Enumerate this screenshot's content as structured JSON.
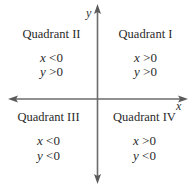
{
  "diagram": {
    "axes": {
      "x_label": "x",
      "y_label": "y",
      "color": "#6b6b6b"
    },
    "quadrants": [
      {
        "id": "I",
        "label": "Quadrant I",
        "x_condition": {
          "var": "x",
          "op": ">",
          "val": "0"
        },
        "y_condition": {
          "var": "y",
          "op": ">",
          "val": "0"
        }
      },
      {
        "id": "II",
        "label": "Quadrant II",
        "x_condition": {
          "var": "x",
          "op": "<",
          "val": "0"
        },
        "y_condition": {
          "var": "y",
          "op": ">",
          "val": "0"
        }
      },
      {
        "id": "III",
        "label": "Quadrant III",
        "x_condition": {
          "var": "x",
          "op": "<",
          "val": "0"
        },
        "y_condition": {
          "var": "y",
          "op": "<",
          "val": "0"
        }
      },
      {
        "id": "IV",
        "label": "Quadrant IV",
        "x_condition": {
          "var": "x",
          "op": ">",
          "val": "0"
        },
        "y_condition": {
          "var": "y",
          "op": "<",
          "val": "0"
        }
      }
    ]
  }
}
